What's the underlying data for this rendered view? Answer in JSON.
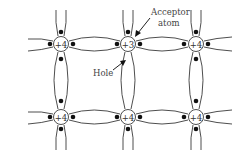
{
  "diagram": {
    "type": "p-type semiconductor crystal lattice",
    "atoms": [
      {
        "id": "a00",
        "label": "+4",
        "row": 0,
        "col": 0,
        "x": 61,
        "y": 44
      },
      {
        "id": "a01",
        "label": "+3",
        "row": 0,
        "col": 1,
        "x": 128,
        "y": 44
      },
      {
        "id": "a02",
        "label": "+4",
        "row": 0,
        "col": 2,
        "x": 196,
        "y": 44
      },
      {
        "id": "a10",
        "label": "+4",
        "row": 1,
        "col": 0,
        "x": 61,
        "y": 117
      },
      {
        "id": "a11",
        "label": "+4",
        "row": 1,
        "col": 1,
        "x": 128,
        "y": 117
      },
      {
        "id": "a12",
        "label": "+4",
        "row": 1,
        "col": 2,
        "x": 196,
        "y": 117
      }
    ],
    "annotations": {
      "acceptor_line1": "Acceptor",
      "acceptor_line2": "atom",
      "hole": "Hole"
    },
    "colors": {
      "line": "#3a3a3a",
      "electron": "#111111",
      "text": "#444444",
      "background": "#ffffff"
    }
  }
}
